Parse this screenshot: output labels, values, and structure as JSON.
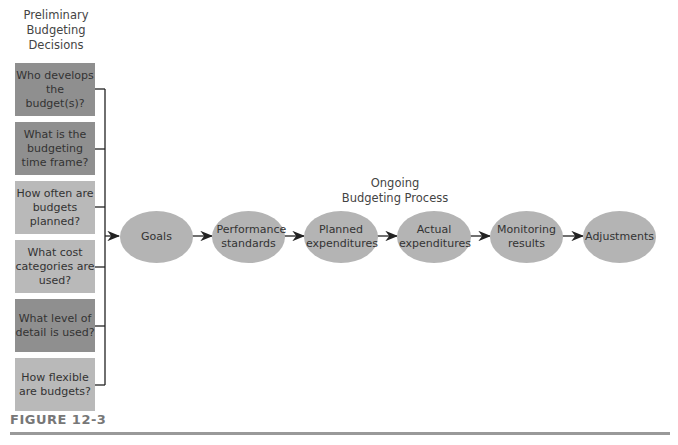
{
  "diagram": {
    "left_header": "Preliminary Budgeting Decisions",
    "left_header_lines": [
      "Preliminary",
      "Budgeting",
      "Decisions"
    ],
    "decisions": [
      {
        "label": "Who develops the budget(s)?",
        "shade": "dark"
      },
      {
        "label": "What is the budgeting time frame?",
        "shade": "dark"
      },
      {
        "label": "How often are budgets planned?",
        "shade": "light"
      },
      {
        "label": "What cost categories are used?",
        "shade": "light"
      },
      {
        "label": "What level of detail is used?",
        "shade": "dark"
      },
      {
        "label": "How flexible are budgets?",
        "shade": "light"
      }
    ],
    "process_header_lines": [
      "Ongoing",
      "Budgeting Process"
    ],
    "process_steps": [
      {
        "label": "Goals"
      },
      {
        "label": "Performance standards"
      },
      {
        "label": "Planned expenditures"
      },
      {
        "label": "Actual expenditures"
      },
      {
        "label": "Monitoring results"
      },
      {
        "label": "Adjustments"
      }
    ],
    "figure_label": "FIGURE 12-3",
    "colors": {
      "dark_box": "#8f8f8f",
      "light_box": "#b9b9b9",
      "ellipse": "#b4b4b4",
      "line": "#222222",
      "rule": "#999999"
    }
  }
}
